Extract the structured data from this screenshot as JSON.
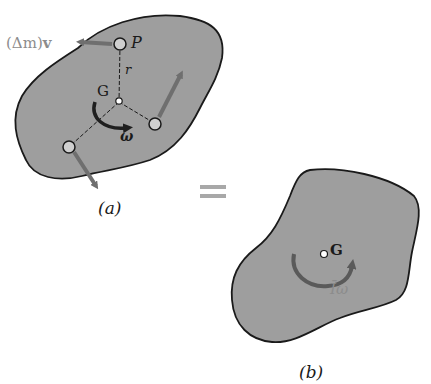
{
  "figure_a": {
    "caption": "(a)",
    "momentum_label_prefix": "(Δm)",
    "momentum_label_vector": "v",
    "point_P": "P",
    "radius": "r",
    "center": "G",
    "angular_velocity": "ω"
  },
  "equals": "=",
  "figure_b": {
    "caption": "(b)",
    "center": "G",
    "angular_momentum": "Īω"
  },
  "colors": {
    "body_fill": "#9e9e9e",
    "outline": "#1a1a1a",
    "vector_arrow": "#6f6f6f",
    "curved_arrow_a": "#1f1f1f",
    "curved_arrow_b": "#5a5a5a",
    "light_label": "#8c8c8c",
    "particle_fill": "#cfcfcf"
  }
}
